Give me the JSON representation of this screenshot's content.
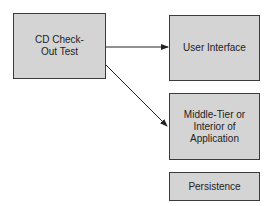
{
  "diagram": {
    "source": {
      "label": "CD Check-Out Test"
    },
    "targets": [
      {
        "label": "User Interface"
      },
      {
        "label": "Middle-Tier or Interior of Application"
      },
      {
        "label": "Persistence"
      }
    ],
    "edges": [
      {
        "from": "CD Check-Out Test",
        "to": "User Interface"
      },
      {
        "from": "CD Check-Out Test",
        "to": "Middle-Tier or Interior of Application"
      }
    ],
    "colors": {
      "box_fill": "#d4d4d4",
      "box_border": "#3a3a3a",
      "arrow": "#222222"
    }
  }
}
